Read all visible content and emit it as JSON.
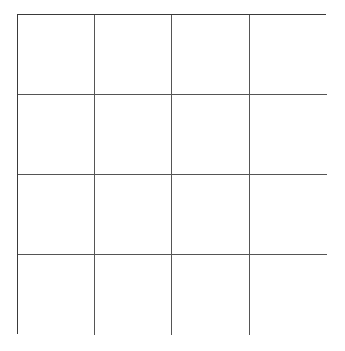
{
  "grid": {
    "rows": 4,
    "columns": 4,
    "line_color": "#555555",
    "border_color": "#3a3a3a",
    "background": "#ffffff",
    "cells": [
      [
        "",
        "",
        "",
        ""
      ],
      [
        "",
        "",
        "",
        ""
      ],
      [
        "",
        "",
        "",
        ""
      ],
      [
        "",
        "",
        "",
        ""
      ]
    ]
  }
}
